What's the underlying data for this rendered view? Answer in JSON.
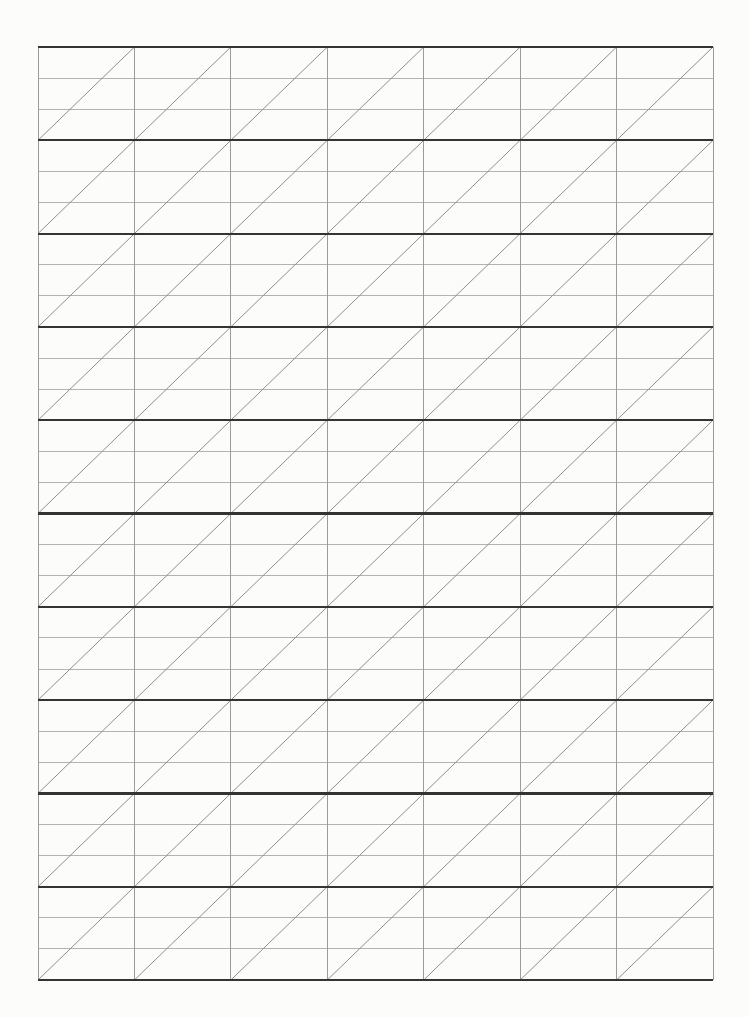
{
  "page": {
    "sheet_type": "slanted-grid-practice-paper",
    "canvas_width": 749,
    "canvas_height": 1017,
    "background_color": "#fcfcfa"
  },
  "grid": {
    "x": 38,
    "y": 47,
    "width": 675,
    "height": 933,
    "columns": 7,
    "rows": 10,
    "row_subdivisions": 3,
    "diagonal_direction": "bottom-left-to-top-right",
    "colors": {
      "row_line": "#343434",
      "column_line": "#9b9b9b",
      "subdivision_line": "#b3b3b3",
      "diagonal_line": "#8f8f8f"
    },
    "stroke_widths": {
      "row_line": 2.2,
      "column_line": 1,
      "subdivision_line": 1,
      "diagonal_line": 1
    }
  }
}
